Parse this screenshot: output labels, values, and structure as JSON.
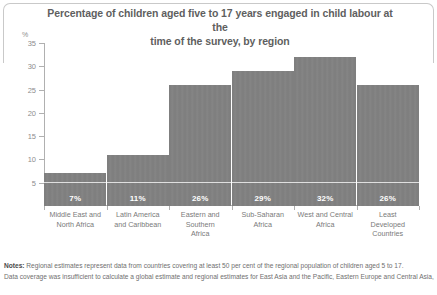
{
  "chart_data": {
    "type": "bar",
    "title": "Percentage of children aged five to 17 years engaged in child labour at the time of the survey, by region",
    "title_line1": "Percentage of children aged five to 17 years engaged in child labour at the",
    "title_line2": "time of the survey, by region",
    "ylabel": "%",
    "xlabel": "",
    "ylim": [
      0,
      35
    ],
    "yticks": [
      0,
      5,
      10,
      15,
      20,
      25,
      30,
      35
    ],
    "ytick_labels": [
      "",
      "5",
      "10",
      "15",
      "20",
      "25",
      "30",
      "35"
    ],
    "grid": false,
    "legend": "none",
    "categories": [
      "Middle East and North Africa",
      "Latin America and Caribbean",
      "Eastern and Southern Africa",
      "Sub-Saharan Africa",
      "West and Central Africa",
      "Least Developed Countries"
    ],
    "category_lines": [
      [
        "Middle East and",
        "North Africa"
      ],
      [
        "Latin America",
        "and Caribbean"
      ],
      [
        "Eastern and",
        "Southern",
        "Africa"
      ],
      [
        "Sub-Saharan",
        "Africa"
      ],
      [
        "West and Central",
        "Africa"
      ],
      [
        "Least",
        "Developed",
        "Countries"
      ]
    ],
    "values": [
      7,
      11,
      26,
      29,
      32,
      26
    ],
    "data_labels": [
      "7%",
      "11%",
      "26%",
      "29%",
      "32%",
      "26%"
    ],
    "bar_color": "#7f7f7f",
    "data_label_color": "#ffffff",
    "axis_color": "#b0b0b0",
    "text_color": "#6f6f6f"
  },
  "notes": {
    "label": "Notes:",
    "line1": "Regional estimates represent data from countries covering at least 50 per cent of the regional population of children aged 5 to 17.",
    "line2": "Data coverage was insufficient to calculate a global estimate and regional estimates for East Asia and the Pacific, Eastern Europe and Central Asia,"
  }
}
